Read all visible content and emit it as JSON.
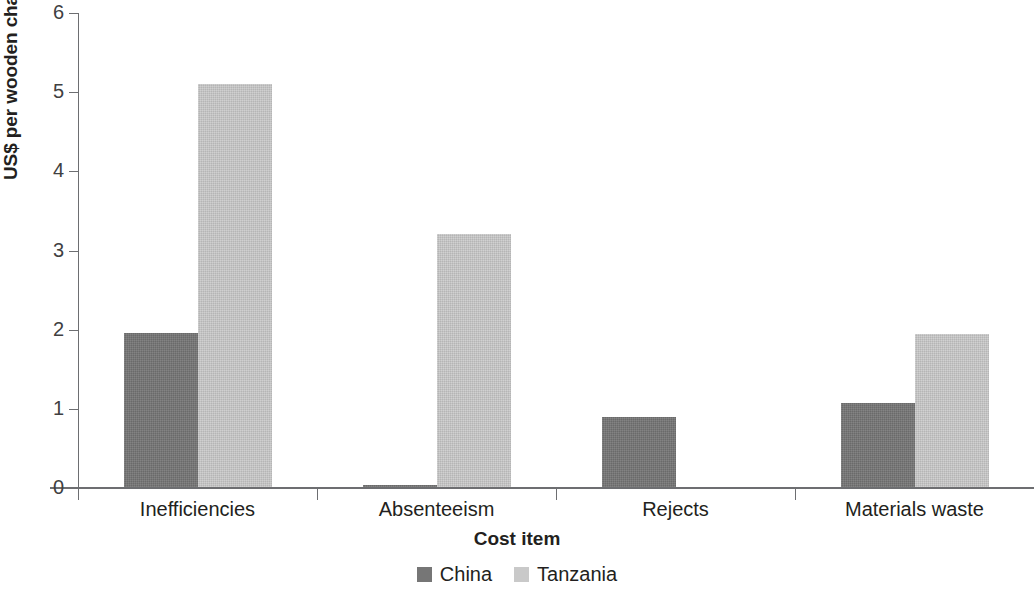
{
  "chart_data": {
    "type": "bar",
    "title": "",
    "subtitle": "",
    "xlabel": "Cost item",
    "ylabel": "US$ per wooden chair",
    "categories": [
      "Inefficiencies",
      "Absenteeism",
      "Rejects",
      "Materials waste"
    ],
    "series": [
      {
        "name": "China",
        "color": "#767676",
        "values": [
          1.94,
          0.02,
          0.88,
          1.06
        ]
      },
      {
        "name": "Tanzania",
        "color": "#c9c9c9",
        "values": [
          5.09,
          3.19,
          0.0,
          1.93
        ]
      }
    ],
    "ylim": [
      0,
      6
    ],
    "yticks": [
      0,
      1,
      2,
      3,
      4,
      5,
      6
    ],
    "ytick_labels": [
      "0",
      "1",
      "2",
      "3",
      "4",
      "5",
      "6"
    ],
    "grid": false,
    "legend_position": "bottom",
    "annotations": []
  },
  "axes": {
    "y_title": "US$ per wooden chair",
    "x_title": "Cost item"
  },
  "legend": {
    "entries": [
      {
        "label": "China",
        "swatch": "china-swatch-icon"
      },
      {
        "label": "Tanzania",
        "swatch": "tanzania-swatch-icon"
      }
    ]
  }
}
